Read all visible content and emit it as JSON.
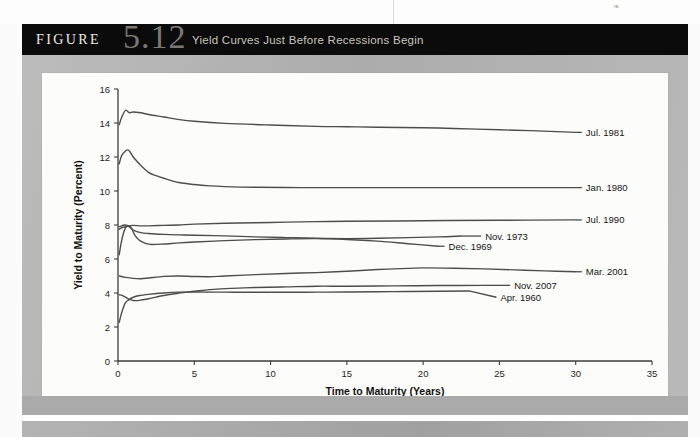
{
  "header": {
    "figure_word": "FIGURE",
    "figure_number": "5.12",
    "title": "Yield Curves Just Before Recessions Begin",
    "bar_color": "#0c0b0b",
    "number_color": "#7b7873"
  },
  "page": {
    "speck_glyph": "❧",
    "panel_color": "#b4b4b4",
    "card_color": "#fcfcfa"
  },
  "chart_data": {
    "type": "line",
    "title": "Yield Curves Just Before Recessions Begin",
    "xlabel": "Time to Maturity (Years)",
    "ylabel": "Yield to Maturity (Percent)",
    "xlim": [
      0,
      35
    ],
    "ylim": [
      0,
      16
    ],
    "xticks": [
      0,
      5,
      10,
      15,
      20,
      25,
      30,
      35
    ],
    "yticks": [
      0,
      2,
      4,
      6,
      8,
      10,
      12,
      14,
      16
    ],
    "xtick_labels": [
      "0",
      "5",
      "10",
      "15",
      "20",
      "25",
      "30",
      "35"
    ],
    "ytick_labels": [
      "0",
      "2",
      "4",
      "6",
      "8",
      "10",
      "12",
      "14",
      "16"
    ],
    "grid": false,
    "legend_position": "inline-right-labels",
    "line_color": "#4d4d4d",
    "series": [
      {
        "name": "Jul. 1981",
        "label_x": 30.6,
        "label_y": 13.45,
        "x": [
          0.08,
          0.25,
          0.5,
          0.75,
          1,
          1.5,
          2,
          3,
          4,
          5,
          7,
          10,
          13,
          15,
          17,
          20,
          22,
          25,
          27,
          30
        ],
        "values": [
          13.9,
          14.35,
          14.75,
          14.6,
          14.65,
          14.6,
          14.5,
          14.35,
          14.2,
          14.1,
          13.98,
          13.88,
          13.8,
          13.78,
          13.75,
          13.72,
          13.68,
          13.6,
          13.55,
          13.45
        ]
      },
      {
        "name": "Jan. 1980",
        "label_x": 30.6,
        "label_y": 10.2,
        "x": [
          0.08,
          0.25,
          0.5,
          0.7,
          1,
          1.5,
          2,
          2.5,
          3,
          4,
          5,
          6,
          7,
          9,
          12,
          15,
          20,
          25,
          30
        ],
        "values": [
          11.6,
          12.1,
          12.35,
          12.4,
          12.0,
          11.5,
          11.1,
          10.9,
          10.75,
          10.5,
          10.38,
          10.3,
          10.26,
          10.22,
          10.2,
          10.2,
          10.2,
          10.2,
          10.2
        ]
      },
      {
        "name": "Jul. 1990",
        "label_x": 30.6,
        "label_y": 8.3,
        "x": [
          0.08,
          0.25,
          0.5,
          0.75,
          1,
          1.5,
          2,
          3,
          4,
          5,
          7,
          10,
          13,
          15,
          20,
          25,
          30
        ],
        "values": [
          7.75,
          7.85,
          7.9,
          7.95,
          7.98,
          7.95,
          7.95,
          7.98,
          8.0,
          8.05,
          8.1,
          8.15,
          8.2,
          8.22,
          8.25,
          8.28,
          8.3
        ]
      },
      {
        "name": "Nov. 1973",
        "label_x": 24.0,
        "label_y": 7.35,
        "x": [
          0.08,
          0.25,
          0.4,
          0.6,
          0.8,
          1,
          1.5,
          2,
          3,
          4,
          5,
          7,
          9,
          11,
          13,
          15,
          17,
          19,
          21,
          22.5
        ],
        "values": [
          7.9,
          7.95,
          8.0,
          7.98,
          7.85,
          7.7,
          7.55,
          7.5,
          7.45,
          7.42,
          7.4,
          7.36,
          7.3,
          7.26,
          7.22,
          7.2,
          7.22,
          7.26,
          7.3,
          7.35
        ]
      },
      {
        "name": "Dec. 1969",
        "label_x": 21.6,
        "label_y": 6.75,
        "x": [
          0.08,
          0.2,
          0.35,
          0.5,
          0.7,
          0.9,
          1.1,
          1.4,
          1.8,
          2.2,
          3,
          4,
          5,
          7,
          9,
          11,
          13,
          15,
          17,
          19,
          21
        ],
        "values": [
          6.25,
          6.9,
          7.5,
          7.85,
          7.95,
          7.8,
          7.4,
          7.1,
          6.92,
          6.85,
          6.88,
          6.95,
          7.0,
          7.08,
          7.14,
          7.18,
          7.2,
          7.15,
          7.05,
          6.9,
          6.75
        ]
      },
      {
        "name": "Mar. 2001",
        "label_x": 30.6,
        "label_y": 5.25,
        "x": [
          0.08,
          0.5,
          1,
          1.5,
          2,
          3,
          4,
          5,
          6,
          7,
          9,
          11,
          13,
          15,
          17,
          19,
          20,
          22,
          24,
          26,
          28,
          30
        ],
        "values": [
          5.0,
          4.92,
          4.86,
          4.84,
          4.88,
          4.98,
          5.0,
          4.97,
          4.96,
          5.0,
          5.08,
          5.15,
          5.2,
          5.28,
          5.38,
          5.45,
          5.48,
          5.46,
          5.42,
          5.36,
          5.3,
          5.25
        ]
      },
      {
        "name": "Nov. 2007",
        "label_x": 25.9,
        "label_y": 4.45,
        "x": [
          0.08,
          0.3,
          0.6,
          0.9,
          1.2,
          1.6,
          2,
          2.5,
          3,
          4,
          5,
          6,
          7,
          9,
          11,
          13,
          15,
          18,
          21,
          24
        ],
        "values": [
          3.9,
          3.85,
          3.7,
          3.58,
          3.55,
          3.6,
          3.66,
          3.76,
          3.85,
          4.0,
          4.1,
          4.2,
          4.26,
          4.32,
          4.36,
          4.4,
          4.4,
          4.42,
          4.44,
          4.45
        ]
      },
      {
        "name": "Apr. 1960",
        "label_x": 25.0,
        "label_y": 3.75,
        "x": [
          0.08,
          0.2,
          0.35,
          0.5,
          0.7,
          1,
          1.4,
          2,
          3,
          4,
          5,
          7,
          9,
          11,
          13,
          15,
          18,
          21,
          23
        ],
        "values": [
          2.28,
          2.7,
          3.15,
          3.45,
          3.6,
          3.75,
          3.85,
          3.92,
          4.0,
          4.05,
          4.06,
          4.05,
          4.04,
          4.04,
          4.05,
          4.06,
          4.08,
          4.1,
          4.12
        ]
      }
    ]
  }
}
